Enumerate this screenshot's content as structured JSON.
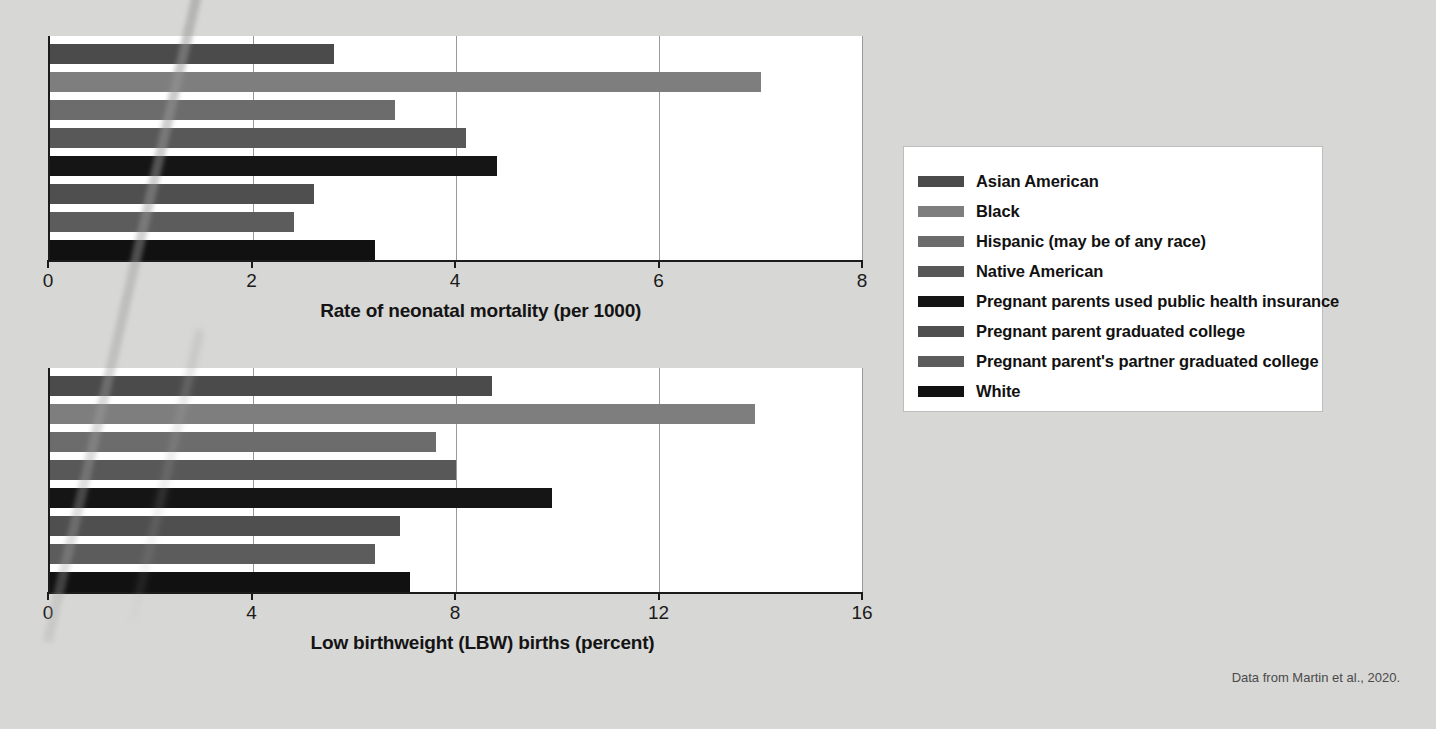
{
  "attribution": "Data from Martin et al., 2020.",
  "legend": {
    "items": [
      {
        "label": "Asian American",
        "color": "#4b4b4b"
      },
      {
        "label": "Black",
        "color": "#7e7e7e"
      },
      {
        "label": "Hispanic (may be of any race)",
        "color": "#6c6c6c"
      },
      {
        "label": "Native American",
        "color": "#585858"
      },
      {
        "label": "Pregnant parents used public health insurance",
        "color": "#151515"
      },
      {
        "label": "Pregnant parent graduated college",
        "color": "#4f4f4f"
      },
      {
        "label": "Pregnant parent's partner graduated college",
        "color": "#5c5c5c"
      },
      {
        "label": "White",
        "color": "#111111"
      }
    ]
  },
  "chart_data": [
    {
      "id": "neonatal-mortality",
      "type": "bar",
      "orientation": "horizontal",
      "title": "",
      "xlabel": "Rate of neonatal mortality (per 1000)",
      "ylabel": "",
      "xlim": [
        0,
        8
      ],
      "xticks": [
        0,
        2,
        4,
        6,
        8
      ],
      "xtick_labels": [
        "0",
        "2",
        "4",
        "6",
        "8"
      ],
      "grid": true,
      "legend_position": "right-outside",
      "categories": [
        "Asian American",
        "Black",
        "Hispanic (may be of any race)",
        "Native American",
        "Pregnant parents used public health insurance",
        "Pregnant parent graduated college",
        "Pregnant parent's partner graduated college",
        "White"
      ],
      "values": [
        2.8,
        7.0,
        3.4,
        4.1,
        4.4,
        2.6,
        2.4,
        3.2
      ],
      "colors": [
        "#4b4b4b",
        "#7e7e7e",
        "#6c6c6c",
        "#585858",
        "#151515",
        "#4f4f4f",
        "#5c5c5c",
        "#111111"
      ]
    },
    {
      "id": "low-birthweight",
      "type": "bar",
      "orientation": "horizontal",
      "title": "",
      "xlabel": "Low birthweight (LBW) births (percent)",
      "ylabel": "",
      "xlim": [
        0,
        16
      ],
      "xticks": [
        0,
        4,
        8,
        12,
        16
      ],
      "xtick_labels": [
        "0",
        "4",
        "8",
        "12",
        "16"
      ],
      "grid": true,
      "legend_position": "right-outside",
      "categories": [
        "Asian American",
        "Black",
        "Hispanic (may be of any race)",
        "Native American",
        "Pregnant parents used public health insurance",
        "Pregnant parent graduated college",
        "Pregnant parent's partner graduated college",
        "White"
      ],
      "values": [
        8.7,
        13.9,
        7.6,
        8.0,
        9.9,
        6.9,
        6.4,
        7.1
      ],
      "colors": [
        "#4b4b4b",
        "#7e7e7e",
        "#6c6c6c",
        "#585858",
        "#151515",
        "#4f4f4f",
        "#5c5c5c",
        "#111111"
      ]
    }
  ]
}
